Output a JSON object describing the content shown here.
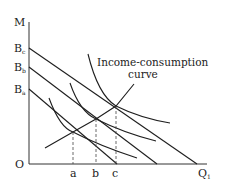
{
  "diagram": {
    "type": "economics-indifference-curve",
    "axes": {
      "y_label": "M",
      "x_label": "Q",
      "x_label_subscript": "1",
      "origin_label": "O"
    },
    "y_intercepts": [
      {
        "id": "Ba",
        "base": "B",
        "sub": "a"
      },
      {
        "id": "Bb",
        "base": "B",
        "sub": "b"
      },
      {
        "id": "Bc",
        "base": "B",
        "sub": "c"
      }
    ],
    "x_ticks": [
      {
        "id": "a",
        "label": "a"
      },
      {
        "id": "b",
        "label": "b"
      },
      {
        "id": "c",
        "label": "c"
      }
    ],
    "annotation": {
      "line1": "Income-consumption",
      "line2": "curve"
    },
    "elements": {
      "budget_lines": 3,
      "indifference_curves": 3,
      "tangency_points": 3,
      "income_consumption_curve": 1
    },
    "colors": {
      "line": "#1e1e1e",
      "text": "#222222",
      "background": "#ffffff"
    }
  }
}
